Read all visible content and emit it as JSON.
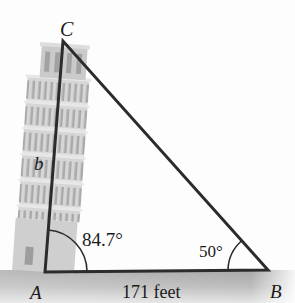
{
  "diagram": {
    "type": "triangle",
    "vertices": {
      "A": {
        "label": "A"
      },
      "B": {
        "label": "B"
      },
      "C": {
        "label": "C"
      }
    },
    "side_labels": {
      "AC": "b",
      "AB": "171 feet"
    },
    "angle_labels": {
      "A": "84.7°",
      "B": "50°"
    },
    "colors": {
      "line": "#2b2b2b",
      "tower": "#b9b9b9",
      "ground": "#9a9a9a",
      "background": "#fdfdfd"
    }
  }
}
